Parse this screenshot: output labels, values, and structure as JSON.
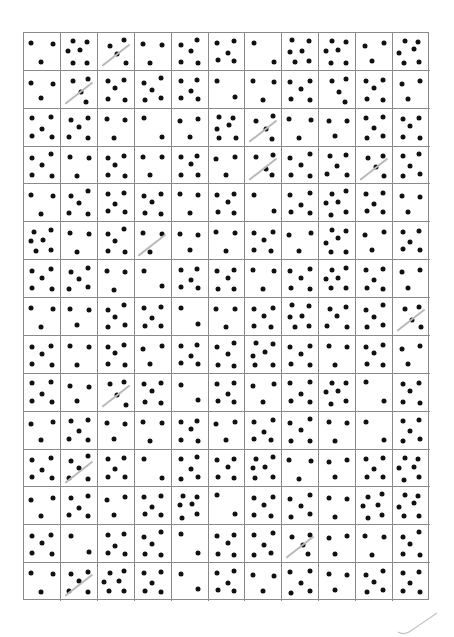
{
  "sheet": {
    "rows": 15,
    "cols": 11,
    "grid_color": "#8a8a8a",
    "dot_color": "#111111",
    "pencil_color": "#b9b9b9",
    "dot_counts": [
      [
        3,
        6,
        4,
        3,
        5,
        5,
        2,
        6,
        6,
        3,
        6
      ],
      [
        3,
        4,
        5,
        5,
        5,
        2,
        3,
        5,
        4,
        5,
        3
      ],
      [
        5,
        5,
        3,
        2,
        3,
        6,
        4,
        3,
        3,
        5,
        5
      ],
      [
        5,
        3,
        5,
        3,
        5,
        3,
        4,
        5,
        5,
        4,
        5
      ],
      [
        3,
        5,
        5,
        5,
        3,
        5,
        2,
        5,
        6,
        5,
        3
      ],
      [
        6,
        3,
        5,
        3,
        3,
        3,
        5,
        3,
        6,
        3,
        5
      ],
      [
        5,
        5,
        3,
        2,
        5,
        5,
        3,
        5,
        6,
        5,
        3
      ],
      [
        3,
        3,
        5,
        5,
        2,
        3,
        5,
        6,
        5,
        5,
        4
      ],
      [
        5,
        3,
        5,
        3,
        5,
        5,
        6,
        5,
        3,
        5,
        3
      ],
      [
        5,
        3,
        4,
        5,
        2,
        5,
        3,
        5,
        6,
        2,
        5
      ],
      [
        3,
        5,
        3,
        3,
        5,
        3,
        5,
        5,
        3,
        2,
        5
      ],
      [
        5,
        5,
        5,
        2,
        5,
        5,
        6,
        3,
        3,
        5,
        6
      ],
      [
        3,
        5,
        3,
        5,
        6,
        2,
        5,
        5,
        3,
        6,
        6
      ],
      [
        5,
        2,
        5,
        5,
        2,
        5,
        5,
        4,
        3,
        3,
        5
      ],
      [
        3,
        5,
        6,
        5,
        2,
        5,
        3,
        5,
        3,
        5,
        5
      ]
    ],
    "pencil_marks": [
      [
        1,
        3
      ],
      [
        2,
        2
      ],
      [
        3,
        7
      ],
      [
        4,
        7
      ],
      [
        4,
        10
      ],
      [
        6,
        4
      ],
      [
        8,
        11
      ],
      [
        10,
        3
      ],
      [
        12,
        2
      ],
      [
        14,
        8
      ],
      [
        15,
        2
      ]
    ]
  }
}
